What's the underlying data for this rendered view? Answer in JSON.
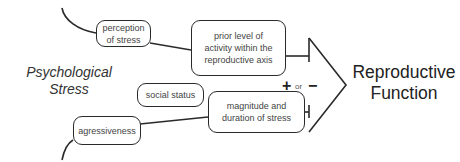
{
  "diagram": {
    "source_label": {
      "line1": "Psychological",
      "line2": "Stress"
    },
    "target_label": {
      "line1": "Reproductive",
      "line2": "Function"
    },
    "nodes": [
      {
        "id": "perception",
        "label": "perception of stress"
      },
      {
        "id": "prior_level",
        "label": "prior level of activity within the reproductive axis"
      },
      {
        "id": "social_status",
        "label": "social status"
      },
      {
        "id": "magnitude",
        "label": "magnitude and duration of stress"
      },
      {
        "id": "aggressiveness",
        "label": "agressiveness"
      }
    ],
    "effect": {
      "plus": "+",
      "or": "or",
      "minus": "−"
    },
    "colors": {
      "line": "#2a2a2a",
      "text": "#333333",
      "background": "#ffffff"
    }
  }
}
